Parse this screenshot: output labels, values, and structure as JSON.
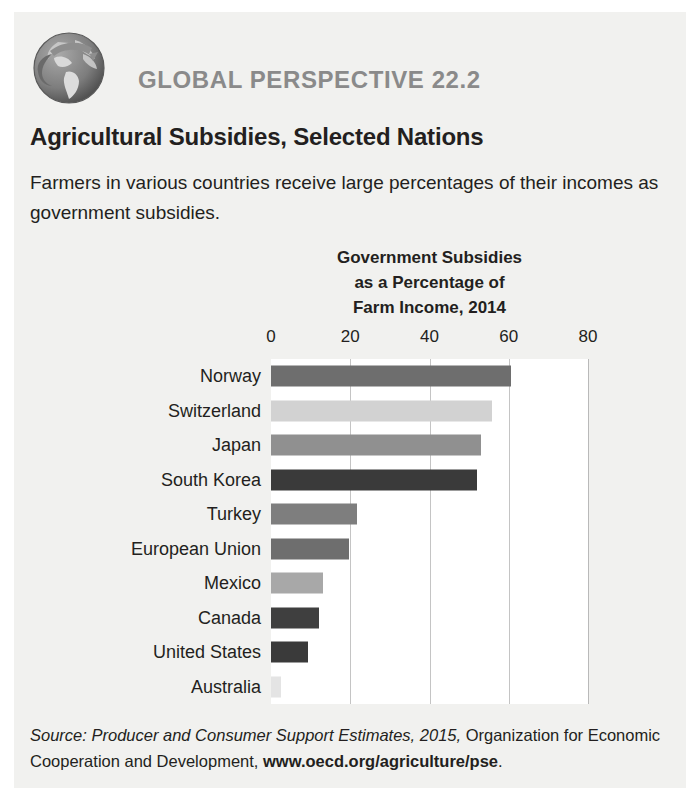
{
  "header": {
    "icon": "globe-icon",
    "eyebrow": "GLOBAL PERSPECTIVE 22.2",
    "title": "Agricultural Subsidies, Selected Nations",
    "description": "Farmers in various countries receive large percentages of their incomes as government subsidies."
  },
  "source": {
    "label": "Source:",
    "italic_part": "Producer and Consumer Support Estimates, 2015,",
    "plain_part": "Organization for Economic Cooperation and Development,",
    "bold_part": "www.oecd.org/agriculture/pse",
    "period": "."
  },
  "colors": {
    "page_background": "#f1f1ef",
    "plot_background": "#ffffff",
    "gridline": "#c4c4c4",
    "eyebrow": "#8a8a8a",
    "text": "#231f20"
  },
  "chart_data": {
    "type": "bar",
    "orientation": "horizontal",
    "title": "Government Subsidies as a Percentage of Farm Income, 2014",
    "title_lines": [
      "Government Subsidies",
      "as a Percentage of",
      "Farm Income, 2014"
    ],
    "xlabel": "",
    "ylabel": "",
    "xlim": [
      0,
      80
    ],
    "xticks": [
      0,
      20,
      40,
      60,
      80
    ],
    "xtick_labels": [
      "0",
      "20",
      "40",
      "60",
      "80"
    ],
    "grid": true,
    "legend": "none",
    "categories": [
      "Norway",
      "Switzerland",
      "Japan",
      "South Korea",
      "Turkey",
      "European Union",
      "Mexico",
      "Canada",
      "United States",
      "Australia"
    ],
    "values": [
      60.5,
      55.8,
      53,
      52,
      21.7,
      19.7,
      13.2,
      12,
      9.4,
      2.5
    ],
    "bar_colors": [
      "#6e6e6e",
      "#d2d2d2",
      "#909090",
      "#3a3a3a",
      "#7e7e7e",
      "#6e6e6e",
      "#a8a8a8",
      "#3f3f3f",
      "#3a3a3a",
      "#e4e4e4"
    ]
  }
}
